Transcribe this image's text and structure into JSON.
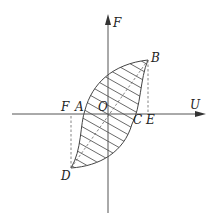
{
  "figure": {
    "type": "hysteresis-loop",
    "axes": {
      "horizontal": {
        "label": "U"
      },
      "vertical": {
        "label": "F"
      },
      "origin": {
        "label": "O"
      }
    },
    "points": [
      {
        "id": "A",
        "label": "A",
        "description": "left curve crossing of U-axis"
      },
      {
        "id": "B",
        "label": "B",
        "description": "upper-right extreme of loop"
      },
      {
        "id": "C",
        "label": "C",
        "description": "right curve crossing of U-axis"
      },
      {
        "id": "D",
        "label": "D",
        "description": "lower-left extreme of loop"
      },
      {
        "id": "E",
        "label": "E",
        "description": "projection of B onto U-axis"
      },
      {
        "id": "F",
        "label": "F",
        "description": "projection of D onto U-axis"
      }
    ],
    "fill": "hatched",
    "dashed_lines": [
      "B-E",
      "D-F",
      "D-B diagonal"
    ],
    "colors": {
      "line": "#444444",
      "axis": "#555555",
      "background": "#ffffff"
    }
  }
}
